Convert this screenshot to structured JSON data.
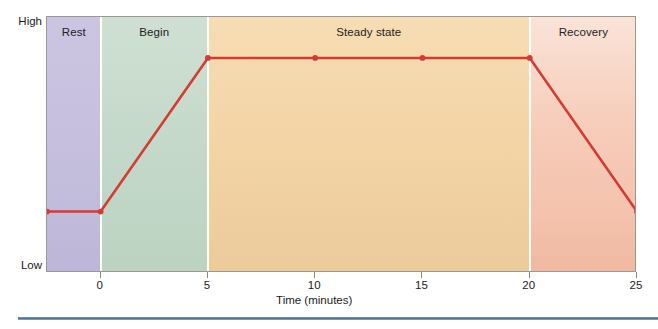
{
  "axes": {
    "y_top_label": "High",
    "y_bottom_label": "Low",
    "x_title": "Time (minutes)",
    "x_ticks": [
      "0",
      "5",
      "10",
      "15",
      "20",
      "25"
    ]
  },
  "phases": [
    {
      "label": "Rest",
      "color": "#c6c0de"
    },
    {
      "label": "Begin",
      "color": "#c3d8c8"
    },
    {
      "label": "Steady state",
      "color": "#f2d3a4"
    },
    {
      "label": "Recovery",
      "color": "#f4c2ad"
    }
  ],
  "colors": {
    "line": "#d33b33",
    "frame": "#9b9792",
    "rule": "#4d6f95",
    "text": "#1b1b1b"
  },
  "chart_data": {
    "type": "line",
    "title": "",
    "subtitle": "",
    "xlabel": "Time (minutes)",
    "ylabel": "",
    "xlim": [
      -2.5,
      25
    ],
    "ylim": [
      0,
      100
    ],
    "ytick_labels": [
      "Low",
      "High"
    ],
    "xtick_values": [
      0,
      5,
      10,
      15,
      20,
      25
    ],
    "grid": false,
    "legend": "none",
    "series": [
      {
        "name": "Oxygen uptake",
        "x": [
          -2.5,
          0,
          5,
          10,
          15,
          20,
          25
        ],
        "y": [
          24,
          24,
          84,
          84,
          84,
          84,
          24
        ],
        "markers": true
      }
    ],
    "annotations": [
      {
        "text": "Rest",
        "x_range": [
          -2.5,
          0
        ],
        "position": "top-center"
      },
      {
        "text": "Begin",
        "x_range": [
          0,
          5
        ],
        "position": "top-center"
      },
      {
        "text": "Steady state",
        "x_range": [
          5,
          20
        ],
        "position": "top-center"
      },
      {
        "text": "Recovery",
        "x_range": [
          20,
          25
        ],
        "position": "top-center"
      }
    ]
  }
}
